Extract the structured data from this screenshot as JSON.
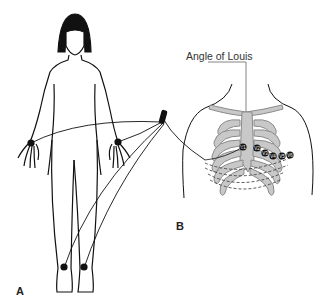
{
  "figure": {
    "panels": [
      {
        "id": "A",
        "label": "A",
        "description": "Front view of body with four limb electrodes (both wrists, both ankles) wired to a lead connector"
      },
      {
        "id": "B",
        "label": "B",
        "description": "Chest with rib cage showing precordial electrode placement"
      }
    ],
    "callouts": {
      "angle_of_louis": "Angle of Louis"
    },
    "limb_electrodes": [
      "right-wrist",
      "left-wrist",
      "right-ankle",
      "left-ankle"
    ],
    "chest_electrodes": [
      "V1",
      "V2",
      "V3",
      "V4",
      "V5",
      "V6"
    ],
    "colors": {
      "line": "#111111",
      "rib": "#9a9a9a",
      "rib_fill": "#c8c8c8",
      "electrode": "#111111",
      "hair": "#111111"
    }
  }
}
